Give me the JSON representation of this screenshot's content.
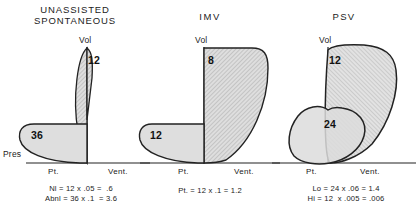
{
  "figure": {
    "kind": "pressure-volume-loop-diagram",
    "background": "#ffffff",
    "ink_color": "#222222",
    "fill_light": "#d8d8d8",
    "fill_hatch": "#c9c9c9"
  },
  "panels": [
    {
      "id": "unassisted-spontaneous",
      "title_line1": "UNASSISTED",
      "title_line2": "SPONTANEOUS",
      "vol_axis_label": "Vol",
      "pres_axis_label": "Pres",
      "x_left_label": "Pt.",
      "x_right_label": "Vent.",
      "loops": [
        {
          "name": "volume-loop",
          "value": "12"
        },
        {
          "name": "pressure-loop",
          "value": "36"
        }
      ],
      "formulas": [
        "Nl = 12 x .05 =  .6",
        "Abnl = 36 x .1  = 3.6"
      ]
    },
    {
      "id": "imv",
      "title_line1": "IMV",
      "title_line2": "",
      "vol_axis_label": "Vol",
      "pres_axis_label": "",
      "x_left_label": "Pt.",
      "x_right_label": "Vent.",
      "loops": [
        {
          "name": "vent-loop",
          "value": "8"
        },
        {
          "name": "patient-loop",
          "value": "12"
        }
      ],
      "formulas": [
        "Pt. = 12 x .1 = 1.2"
      ]
    },
    {
      "id": "psv",
      "title_line1": "PSV",
      "title_line2": "",
      "vol_axis_label": "Vol",
      "pres_axis_label": "",
      "x_left_label": "Pt.",
      "x_right_label": "Vent.",
      "loops": [
        {
          "name": "high-support-loop",
          "value": "12"
        },
        {
          "name": "low-support-loop",
          "value": "24"
        }
      ],
      "formulas": [
        "Lo = 24 x .06 = 1.4",
        "Hi = 12  x .005 = .006"
      ]
    }
  ]
}
